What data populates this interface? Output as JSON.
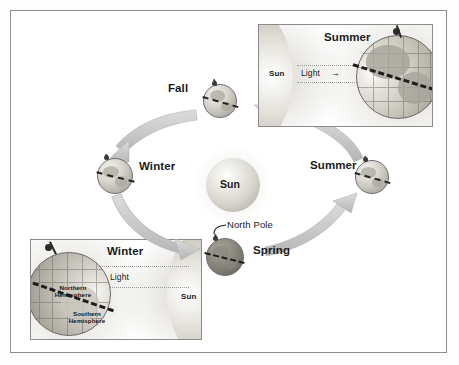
{
  "figure": {
    "background_color": "#ffffff",
    "border_color": "#8d8d8d"
  },
  "center": {
    "sun_label": "Sun"
  },
  "orbit": {
    "direction": "counterclockwise",
    "positions": [
      {
        "key": "fall",
        "label": "Fall",
        "globe_shade": "light",
        "label_side": "left"
      },
      {
        "key": "winter",
        "label": "Winter",
        "globe_shade": "light",
        "label_side": "right"
      },
      {
        "key": "spring",
        "label": "Spring",
        "globe_shade": "dark",
        "label_side": "right"
      },
      {
        "key": "summer",
        "label": "Summer",
        "globe_shade": "light",
        "label_side": "left"
      }
    ],
    "north_pole_label": "North Pole"
  },
  "insets": [
    {
      "key": "summer-inset",
      "title": "Summer",
      "sun_label": "Sun",
      "light_label": "Light",
      "light_arrow": "→",
      "light_direction": "right",
      "sun_side": "left",
      "hemisphere_labels": []
    },
    {
      "key": "winter-inset",
      "title": "Winter",
      "sun_label": "Sun",
      "light_label": "Light",
      "light_arrow": "←",
      "light_direction": "left",
      "sun_side": "right",
      "hemisphere_labels": [
        {
          "line1": "Northern",
          "line2": "Hemisphere"
        },
        {
          "line1": "Southern",
          "line2": "Hemisphere"
        }
      ]
    }
  ],
  "colors": {
    "arrow_fill": "#c9c9c9",
    "arrow_edge": "#b0b0b0",
    "text": "#1b1b1b",
    "globe_outline": "#6f6f6f",
    "tilt_line": "#242424"
  }
}
